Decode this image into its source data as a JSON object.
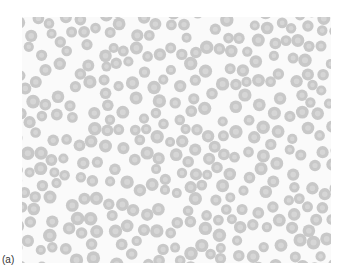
{
  "figure": {
    "label": "(a)",
    "cell_color": "#c8c8c8",
    "cell_center_color": "#d6d6d6",
    "background_color": "#fafafa"
  }
}
